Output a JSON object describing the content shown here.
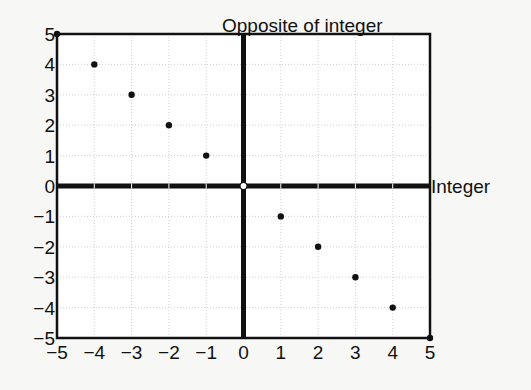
{
  "chart_data": {
    "type": "scatter",
    "title": "",
    "xlabel": "Integer",
    "ylabel": "Opposite of integer",
    "xlim": [
      -5,
      5
    ],
    "ylim": [
      -5,
      5
    ],
    "x_ticks": [
      "-5",
      "-4",
      "-3",
      "-2",
      "-1",
      "0",
      "1",
      "2",
      "3",
      "4",
      "5"
    ],
    "y_ticks": [
      "5",
      "4",
      "3",
      "2",
      "1",
      "0",
      "-1",
      "-2",
      "-3",
      "-4",
      "-5"
    ],
    "grid": true,
    "legend": null,
    "series": [
      {
        "name": "Opposite of integer",
        "points": [
          {
            "x": -5,
            "y": 5
          },
          {
            "x": -4,
            "y": 4
          },
          {
            "x": -3,
            "y": 3
          },
          {
            "x": -2,
            "y": 2
          },
          {
            "x": -1,
            "y": 1
          },
          {
            "x": 0,
            "y": 0
          },
          {
            "x": 1,
            "y": -1
          },
          {
            "x": 2,
            "y": -2
          },
          {
            "x": 3,
            "y": -3
          },
          {
            "x": 4,
            "y": -4
          },
          {
            "x": 5,
            "y": -5
          }
        ]
      }
    ],
    "colors": {
      "axis": "#111111",
      "point": "#111111",
      "grid": "#cfcfcf",
      "background": "#ffffff"
    }
  }
}
